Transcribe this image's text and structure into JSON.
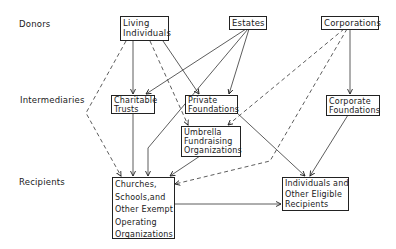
{
  "row_labels": {
    "donors": "Donors",
    "intermediaries": "Intermediaries",
    "recipients": "Recipients"
  },
  "nodes": {
    "living_individuals": [
      "Living",
      "Individuals"
    ],
    "estates": [
      "Estates"
    ],
    "corporations": [
      "Corporations"
    ],
    "charitable_trusts": [
      "Charitable",
      "Trusts"
    ],
    "private_foundations": [
      "Private",
      "Foundations"
    ],
    "corporate_foundations": [
      "Corporate",
      "Foundations"
    ],
    "umbrella": [
      "Umbrella",
      "Fundraising",
      "Organizations"
    ],
    "churches": [
      "Churches,",
      "Schools,and",
      "Other Exempt",
      "Operating",
      "Organizations"
    ],
    "individuals_recipients": [
      "Individuals and",
      "Other Eligible",
      "Recipients"
    ]
  },
  "edges": [
    {
      "from": "Living Individuals",
      "to": "Charitable Trusts",
      "style": "solid"
    },
    {
      "from": "Living Individuals",
      "to": "Private Foundations",
      "style": "solid"
    },
    {
      "from": "Living Individuals",
      "to": "Umbrella Fundraising Organizations",
      "style": "dashed"
    },
    {
      "from": "Living Individuals",
      "to": "Churches, Schools, and Other Exempt Operating Organizations",
      "style": "dashed"
    },
    {
      "from": "Estates",
      "to": "Charitable Trusts",
      "style": "solid"
    },
    {
      "from": "Estates",
      "to": "Private Foundations",
      "style": "solid"
    },
    {
      "from": "Estates",
      "to": "Churches, Schools, and Other Exempt Operating Organizations",
      "style": "solid"
    },
    {
      "from": "Corporations",
      "to": "Corporate Foundations",
      "style": "solid"
    },
    {
      "from": "Corporations",
      "to": "Umbrella Fundraising Organizations",
      "style": "dashed"
    },
    {
      "from": "Corporations",
      "to": "Churches, Schools, and Other Exempt Operating Organizations",
      "style": "dashed"
    },
    {
      "from": "Charitable Trusts",
      "to": "Churches, Schools, and Other Exempt Operating Organizations",
      "style": "solid"
    },
    {
      "from": "Private Foundations",
      "to": "Individuals and Other Eligible Recipients",
      "style": "solid"
    },
    {
      "from": "Umbrella Fundraising Organizations",
      "to": "Churches, Schools, and Other Exempt Operating Organizations",
      "style": "solid"
    },
    {
      "from": "Corporate Foundations",
      "to": "Individuals and Other Eligible Recipients",
      "style": "solid"
    },
    {
      "from": "Churches, Schools, and Other Exempt Operating Organizations",
      "to": "Individuals and Other Eligible Recipients",
      "style": "solid"
    }
  ]
}
